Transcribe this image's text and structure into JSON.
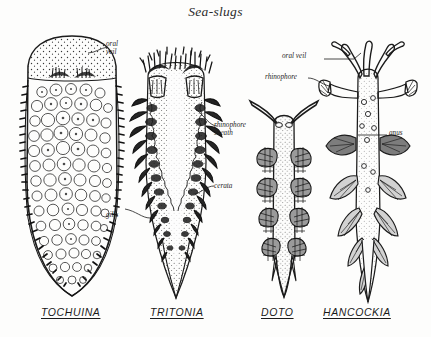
{
  "plate": {
    "title": "Sea-slugs",
    "background_color": "#fdfdfc",
    "ink_color": "#1b1b1b"
  },
  "specimens": [
    {
      "id": "tochuina",
      "genus_label": "TOCHUINA",
      "callouts": [
        {
          "name": "oral-veil",
          "text_line1": "oral",
          "text_line2": "veil"
        },
        {
          "name": "gills",
          "text_line1": "gills",
          "text_line2": ""
        }
      ]
    },
    {
      "id": "tritonia",
      "genus_label": "TRITONIA",
      "callouts": [
        {
          "name": "rhinophore-sheath",
          "text_line1": "rhinophore",
          "text_line2": "sheath"
        },
        {
          "name": "cerata",
          "text_line1": "cerata",
          "text_line2": ""
        }
      ]
    },
    {
      "id": "doto",
      "genus_label": "DOTO",
      "callouts": []
    },
    {
      "id": "hancockia",
      "genus_label": "HANCOCKIA",
      "callouts": [
        {
          "name": "oral-veil",
          "text_line1": "oral veil",
          "text_line2": ""
        },
        {
          "name": "rhinophore",
          "text_line1": "rhinophore",
          "text_line2": ""
        },
        {
          "name": "anus",
          "text_line1": "anus",
          "text_line2": ""
        }
      ]
    }
  ],
  "labels": {
    "oral_veil_left": "oral",
    "oral_veil_left_2": "veil",
    "gills": "gills",
    "rhinophore_sheath_1": "rhinophore",
    "rhinophore_sheath_2": "sheath",
    "cerata": "cerata",
    "oral_veil_right": "oral veil",
    "rhinophore_right": "rhinophore",
    "anus": "anus"
  }
}
